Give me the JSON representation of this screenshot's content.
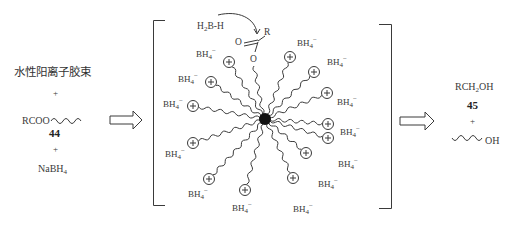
{
  "reactants": {
    "surfactant_label": "水性阳离子胶束",
    "plus1": "+",
    "ester_prefix": "RCOO",
    "ester_number": "44",
    "plus2": "+",
    "reductant": "NaBH",
    "reductant_sub": "4"
  },
  "micelle": {
    "hydride_prefix": "H",
    "hydride_sub": "2",
    "hydride_rest": "B-H",
    "carbonyl_o": "O",
    "carbonyl_r": "R",
    "ester_o": "O",
    "counterion": "BH",
    "counterion_sub": "4",
    "counterion_charge": "−",
    "head_charge": "+",
    "counterions": [
      {
        "x": 196,
        "y": 48
      },
      {
        "x": 178,
        "y": 73
      },
      {
        "x": 163,
        "y": 98
      },
      {
        "x": 165,
        "y": 148
      },
      {
        "x": 188,
        "y": 188
      },
      {
        "x": 232,
        "y": 202
      },
      {
        "x": 293,
        "y": 203
      },
      {
        "x": 318,
        "y": 178
      },
      {
        "x": 338,
        "y": 158
      },
      {
        "x": 340,
        "y": 126
      },
      {
        "x": 337,
        "y": 96
      },
      {
        "x": 327,
        "y": 56
      },
      {
        "x": 297,
        "y": 37
      }
    ]
  },
  "products": {
    "alcohol": "RCH",
    "alcohol_sub": "2",
    "alcohol_rest": "OH",
    "alcohol_number": "45",
    "plus": "+",
    "byproduct": "OH"
  },
  "colors": {
    "line": "#3a3a3a",
    "text": "#3a3a3a",
    "core": "#111111"
  }
}
